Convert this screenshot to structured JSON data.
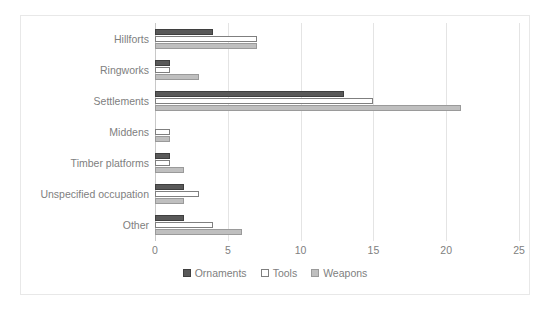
{
  "chart_data": {
    "type": "bar",
    "orientation": "horizontal",
    "title": "",
    "xlabel": "",
    "ylabel": "",
    "xlim": [
      0,
      25
    ],
    "xticks": [
      "0",
      "5",
      "10",
      "15",
      "20",
      "25"
    ],
    "grid": true,
    "legend_position": "bottom",
    "categories": [
      "Hillforts",
      "Ringworks",
      "Settlements",
      "Middens",
      "Timber platforms",
      "Unspecified occupation",
      "Other"
    ],
    "series": [
      {
        "name": "Ornaments",
        "color": "#595959",
        "values": [
          4,
          1,
          13,
          0,
          1,
          2,
          2
        ]
      },
      {
        "name": "Tools",
        "color": "#ffffff",
        "values": [
          7,
          1,
          15,
          1,
          1,
          3,
          4
        ]
      },
      {
        "name": "Weapons",
        "color": "#bfbfbf",
        "values": [
          7,
          3,
          21,
          1,
          2,
          2,
          6
        ]
      }
    ]
  },
  "legend": {
    "items": [
      {
        "label": "Ornaments"
      },
      {
        "label": "Tools"
      },
      {
        "label": "Weapons"
      }
    ]
  }
}
